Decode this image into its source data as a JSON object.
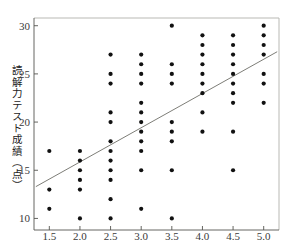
{
  "chart_data": {
    "type": "scatter",
    "title": "",
    "xlabel": "",
    "ylabel": "読解力テスト成績（点）",
    "xlim": [
      1.25,
      5.25
    ],
    "ylim": [
      8.8,
      30.8
    ],
    "xticks": [
      1.5,
      2.0,
      2.5,
      3.0,
      3.5,
      4.0,
      4.5,
      5.0
    ],
    "xtick_labels": [
      "1.5",
      "2.0",
      "2.5",
      "3.0",
      "3.5",
      "4.0",
      "4.5",
      "5.0"
    ],
    "yticks": [
      10,
      15,
      20,
      25,
      30
    ],
    "ytick_labels": [
      "10",
      "15",
      "20",
      "25",
      "30"
    ],
    "grid": false,
    "legend": "none",
    "marker_color": "#111111",
    "line_color": "#6e6e68",
    "frame_color": "#b9b9b4",
    "points": [
      {
        "x": 1.5,
        "y": 17
      },
      {
        "x": 1.5,
        "y": 13
      },
      {
        "x": 1.5,
        "y": 11
      },
      {
        "x": 2.0,
        "y": 17
      },
      {
        "x": 2.0,
        "y": 16
      },
      {
        "x": 2.0,
        "y": 15
      },
      {
        "x": 2.0,
        "y": 14
      },
      {
        "x": 2.0,
        "y": 13
      },
      {
        "x": 2.0,
        "y": 10
      },
      {
        "x": 2.5,
        "y": 27
      },
      {
        "x": 2.5,
        "y": 25
      },
      {
        "x": 2.5,
        "y": 24
      },
      {
        "x": 2.5,
        "y": 21
      },
      {
        "x": 2.5,
        "y": 20
      },
      {
        "x": 2.5,
        "y": 18
      },
      {
        "x": 2.5,
        "y": 17
      },
      {
        "x": 2.5,
        "y": 16
      },
      {
        "x": 2.5,
        "y": 15
      },
      {
        "x": 2.5,
        "y": 14
      },
      {
        "x": 2.5,
        "y": 12
      },
      {
        "x": 2.5,
        "y": 10
      },
      {
        "x": 3.0,
        "y": 27
      },
      {
        "x": 3.0,
        "y": 26
      },
      {
        "x": 3.0,
        "y": 25
      },
      {
        "x": 3.0,
        "y": 24
      },
      {
        "x": 3.0,
        "y": 22
      },
      {
        "x": 3.0,
        "y": 21
      },
      {
        "x": 3.0,
        "y": 20
      },
      {
        "x": 3.0,
        "y": 19
      },
      {
        "x": 3.0,
        "y": 18
      },
      {
        "x": 3.0,
        "y": 17
      },
      {
        "x": 3.0,
        "y": 15
      },
      {
        "x": 3.0,
        "y": 11
      },
      {
        "x": 3.5,
        "y": 30
      },
      {
        "x": 3.5,
        "y": 26
      },
      {
        "x": 3.5,
        "y": 25
      },
      {
        "x": 3.5,
        "y": 24
      },
      {
        "x": 3.5,
        "y": 20
      },
      {
        "x": 3.5,
        "y": 19
      },
      {
        "x": 3.5,
        "y": 18
      },
      {
        "x": 3.5,
        "y": 15
      },
      {
        "x": 3.5,
        "y": 10
      },
      {
        "x": 4.0,
        "y": 29
      },
      {
        "x": 4.0,
        "y": 28
      },
      {
        "x": 4.0,
        "y": 27
      },
      {
        "x": 4.0,
        "y": 26
      },
      {
        "x": 4.0,
        "y": 25
      },
      {
        "x": 4.0,
        "y": 24
      },
      {
        "x": 4.0,
        "y": 23
      },
      {
        "x": 4.0,
        "y": 21
      },
      {
        "x": 4.0,
        "y": 19
      },
      {
        "x": 4.5,
        "y": 29
      },
      {
        "x": 4.5,
        "y": 28
      },
      {
        "x": 4.5,
        "y": 27
      },
      {
        "x": 4.5,
        "y": 26
      },
      {
        "x": 4.5,
        "y": 25
      },
      {
        "x": 4.5,
        "y": 24
      },
      {
        "x": 4.5,
        "y": 23
      },
      {
        "x": 4.5,
        "y": 22
      },
      {
        "x": 4.5,
        "y": 19
      },
      {
        "x": 4.5,
        "y": 15
      },
      {
        "x": 5.0,
        "y": 30
      },
      {
        "x": 5.0,
        "y": 29
      },
      {
        "x": 5.0,
        "y": 28
      },
      {
        "x": 5.0,
        "y": 27
      },
      {
        "x": 5.0,
        "y": 25
      },
      {
        "x": 5.0,
        "y": 24
      },
      {
        "x": 5.0,
        "y": 22
      }
    ],
    "regression_line": {
      "x_start": 1.28,
      "y_start": 13.3,
      "x_end": 5.22,
      "y_end": 27.3
    }
  }
}
